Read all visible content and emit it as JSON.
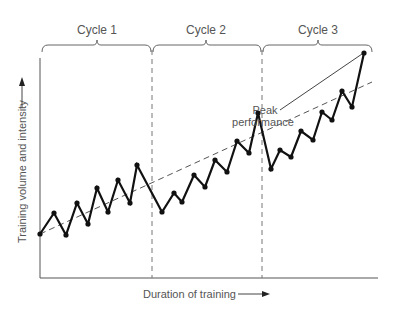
{
  "chart_data": {
    "type": "line",
    "title": "",
    "xlabel": "Duration of training",
    "ylabel": "Training volume and intensity",
    "cycles": [
      {
        "label": "Cycle 1"
      },
      {
        "label": "Cycle 2"
      },
      {
        "label": "Cycle 3"
      }
    ],
    "annotation": {
      "line1": "Peak",
      "line2": "performance"
    },
    "series": [
      {
        "name": "Training load",
        "points": [
          [
            40,
            234
          ],
          [
            54,
            213
          ],
          [
            66,
            235
          ],
          [
            77,
            203
          ],
          [
            88,
            224
          ],
          [
            97,
            188
          ],
          [
            108,
            212
          ],
          [
            118,
            180
          ],
          [
            130,
            203
          ],
          [
            137,
            165
          ],
          [
            162,
            212
          ],
          [
            174,
            193
          ],
          [
            182,
            202
          ],
          [
            194,
            175
          ],
          [
            205,
            187
          ],
          [
            215,
            160
          ],
          [
            227,
            172
          ],
          [
            237,
            141
          ],
          [
            249,
            153
          ],
          [
            258,
            113
          ],
          [
            271,
            169
          ],
          [
            280,
            150
          ],
          [
            291,
            157
          ],
          [
            301,
            131
          ],
          [
            313,
            140
          ],
          [
            322,
            112
          ],
          [
            332,
            120
          ],
          [
            342,
            91
          ],
          [
            352,
            107
          ],
          [
            364,
            53
          ]
        ]
      },
      {
        "name": "Trend",
        "style": "dashed",
        "points": [
          [
            40,
            234
          ],
          [
            370,
            83
          ]
        ]
      }
    ],
    "cycle_dividers_x": [
      152,
      262
    ],
    "grid": false,
    "legend": "none"
  }
}
